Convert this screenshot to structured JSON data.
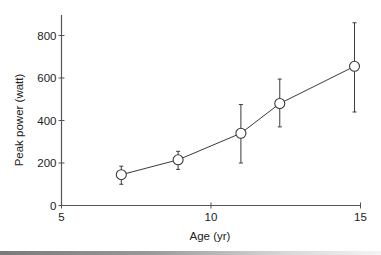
{
  "chart_data": {
    "type": "line",
    "title": "",
    "xlabel": "Age (yr)",
    "ylabel": "Peak power (watt)",
    "xlim": [
      5,
      15
    ],
    "ylim": [
      0,
      900
    ],
    "x_ticks": [
      5,
      10,
      15
    ],
    "y_ticks": [
      0,
      200,
      400,
      600,
      800
    ],
    "grid": false,
    "legend": null,
    "marker": "open-circle",
    "error_bars": true,
    "series": [
      {
        "name": "Peak power",
        "x": [
          7.0,
          8.9,
          11.0,
          12.3,
          14.8
        ],
        "values": [
          145,
          215,
          340,
          480,
          655
        ],
        "error_low": [
          100,
          170,
          200,
          370,
          440
        ],
        "error_high": [
          185,
          255,
          475,
          595,
          860
        ]
      }
    ]
  },
  "labels": {
    "xlabel": "Age (yr)",
    "ylabel": "Peak power (watt)",
    "x_ticks": [
      "5",
      "10",
      "15"
    ],
    "y_ticks": [
      "0",
      "200",
      "400",
      "600",
      "800"
    ]
  },
  "colors": {
    "line": "#3a3a3a",
    "axis": "#555555",
    "marker_fill": "#ffffff"
  }
}
